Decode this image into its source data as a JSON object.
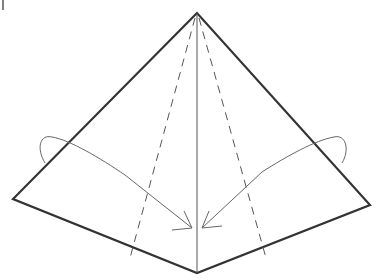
{
  "diagram": {
    "type": "origami-fold-step",
    "colors": {
      "outline": "#333333",
      "crease": "#555555",
      "arrow": "#666666",
      "background": "#ffffff"
    },
    "shape": {
      "apex": [
        197,
        13
      ],
      "left": [
        13,
        199
      ],
      "bottom": [
        197,
        273
      ],
      "right": [
        370,
        205
      ]
    },
    "center_line": {
      "from": [
        197,
        13
      ],
      "to": [
        197,
        273
      ]
    },
    "dashed_lines": [
      {
        "name": "left-valley-fold",
        "from": [
          197,
          13
        ],
        "to": [
          130,
          255
        ]
      },
      {
        "name": "right-valley-fold",
        "from": [
          197,
          13
        ],
        "to": [
          265,
          255
        ]
      }
    ],
    "arrows": [
      {
        "name": "left-fold-arrow",
        "start": [
          45,
          163
        ],
        "end": [
          193,
          228
        ]
      },
      {
        "name": "right-fold-arrow",
        "start": [
          345,
          163
        ],
        "end": [
          201,
          228
        ]
      }
    ],
    "corner_mark": "|"
  }
}
